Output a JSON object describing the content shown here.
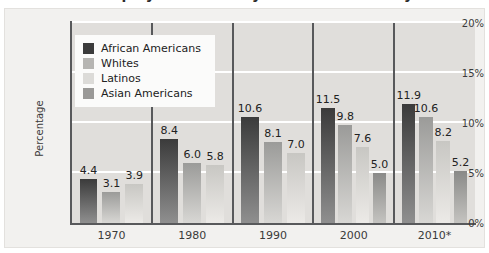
{
  "title_fragment": "Unemployment Rate by Race and Ethnicity",
  "chart_data": {
    "type": "bar",
    "title": "Unemployment Rate by Race and Ethnicity",
    "xlabel": "",
    "ylabel": "Percentage",
    "ylim": [
      0,
      20
    ],
    "yticks": [
      "0%",
      "5%",
      "10%",
      "15%",
      "20%"
    ],
    "ytick_values": [
      0,
      5,
      10,
      15,
      20
    ],
    "grid": true,
    "legend_position": "top-left-inside",
    "categories": [
      "1970",
      "1980",
      "1990",
      "2000",
      "2010*"
    ],
    "series": [
      {
        "name": "African Americans",
        "color": "#3b3b3b",
        "color_bottom": "#8f8f8f",
        "values": [
          4.4,
          8.4,
          10.6,
          11.5,
          11.9
        ],
        "labels": [
          "4.4",
          "8.4",
          "10.6",
          "11.5",
          "11.9"
        ]
      },
      {
        "name": "Whites",
        "color": "#9b9b99",
        "color_bottom": "#d8d7d4",
        "values": [
          3.1,
          6.0,
          8.1,
          9.8,
          10.6
        ],
        "labels": [
          "3.1",
          "6.0",
          "8.1",
          "9.8",
          "10.6"
        ]
      },
      {
        "name": "Latinos",
        "color": "#c8c7c3",
        "color_bottom": "#eceae7",
        "values": [
          3.9,
          5.8,
          7.0,
          7.6,
          8.2
        ],
        "labels": [
          "3.9",
          "5.8",
          "7.0",
          "7.6",
          "8.2"
        ]
      },
      {
        "name": "Asian Americans",
        "color": "#8a8a88",
        "color_bottom": "#c4c3c0",
        "values": [
          null,
          null,
          null,
          5.0,
          5.2
        ],
        "labels": [
          "",
          "",
          "",
          "5.0",
          "5.2"
        ]
      }
    ]
  },
  "legend": {
    "items": [
      {
        "label": "African Americans",
        "swatch": "#3b3b3b"
      },
      {
        "label": "Whites",
        "swatch": "#b6b5b2"
      },
      {
        "label": "Latinos",
        "swatch": "#dcdbd8"
      },
      {
        "label": "Asian Americans",
        "swatch": "#9a9997"
      }
    ]
  },
  "colors": {
    "plot_background": "#e0dedb",
    "card_background": "#f2f1ef",
    "gridline": "#ffffff",
    "axis": "#58595b",
    "text": "#3a3a3a"
  }
}
